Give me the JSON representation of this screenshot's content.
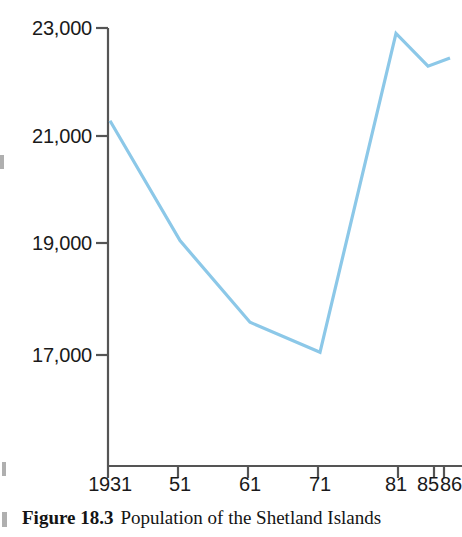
{
  "figure": {
    "caption_figure_no": "Figure 18.3",
    "caption_text": "Population of the Shetland Islands"
  },
  "colors": {
    "line": "#8cc8e8",
    "axis": "#555555",
    "text": "#1a1a1a",
    "background": "#ffffff"
  },
  "chart_data": {
    "type": "line",
    "title": "Population of the Shetland Islands",
    "xlabel": "",
    "ylabel": "",
    "grid": false,
    "legend": "none",
    "x": [
      1931,
      1951,
      1961,
      1971,
      1981,
      1985,
      1986
    ],
    "x_tick_labels": [
      "1931",
      "51",
      "61",
      "71",
      "81",
      "85",
      "86"
    ],
    "y_tick_labels": [
      "23,000",
      "21,000",
      "19,000",
      "17,000"
    ],
    "y_ticks": [
      23000,
      21000,
      19000,
      17000
    ],
    "ylim": [
      15000,
      23000
    ],
    "xlim": [
      1931,
      1986
    ],
    "series": [
      {
        "name": "Population",
        "values": [
          21300,
          19100,
          17600,
          17050,
          22900,
          22300,
          22450
        ]
      }
    ],
    "points": [
      {
        "label": "1931",
        "x": 1931,
        "y": 21300
      },
      {
        "label": "51",
        "x": 1951,
        "y": 19100
      },
      {
        "label": "61",
        "x": 1961,
        "y": 17600
      },
      {
        "label": "71",
        "x": 1971,
        "y": 17050
      },
      {
        "label": "81",
        "x": 1981,
        "y": 22900
      },
      {
        "label": "85",
        "x": 1985,
        "y": 22300
      },
      {
        "label": "86",
        "x": 1986,
        "y": 22450
      }
    ]
  },
  "axes": {
    "y_labels": [
      {
        "text": "23,000",
        "px_top": 18,
        "px_right": 92
      },
      {
        "text": "21,000",
        "px_top": 126,
        "px_right": 92
      },
      {
        "text": "19,000",
        "px_top": 233,
        "px_right": 92
      },
      {
        "text": "17,000",
        "px_top": 345,
        "px_right": 92
      }
    ],
    "x_labels": [
      {
        "text": "1931",
        "px_center": 110,
        "px_top": 474
      },
      {
        "text": "51",
        "px_center": 180,
        "px_top": 474
      },
      {
        "text": "61",
        "px_center": 250,
        "px_top": 474
      },
      {
        "text": "71",
        "px_center": 320,
        "px_top": 474
      },
      {
        "text": "81",
        "px_center": 396,
        "px_top": 474
      },
      {
        "text": "85",
        "px_center": 428,
        "px_top": 474
      },
      {
        "text": "86",
        "px_center": 452,
        "px_top": 474
      }
    ]
  }
}
